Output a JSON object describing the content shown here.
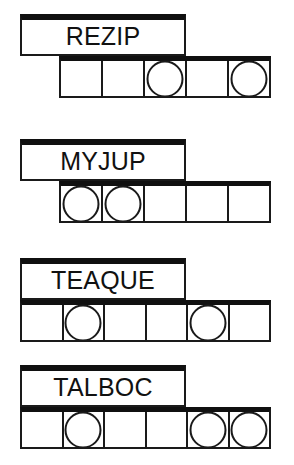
{
  "page": {
    "background_color": "#ffffff",
    "ink_color": "#1a1a1a"
  },
  "puzzles": [
    {
      "word": "REZIP",
      "cell_count": 5,
      "circled_positions": [
        3,
        5
      ],
      "cells": [
        {
          "letter": "",
          "circled": false
        },
        {
          "letter": "",
          "circled": false
        },
        {
          "letter": "",
          "circled": true
        },
        {
          "letter": "",
          "circled": false
        },
        {
          "letter": "",
          "circled": true
        }
      ]
    },
    {
      "word": "MYJUP",
      "cell_count": 5,
      "circled_positions": [
        1,
        2
      ],
      "cells": [
        {
          "letter": "",
          "circled": true
        },
        {
          "letter": "",
          "circled": true
        },
        {
          "letter": "",
          "circled": false
        },
        {
          "letter": "",
          "circled": false
        },
        {
          "letter": "",
          "circled": false
        }
      ]
    },
    {
      "word": "TEAQUE",
      "cell_count": 6,
      "circled_positions": [
        2,
        5
      ],
      "cells": [
        {
          "letter": "",
          "circled": false
        },
        {
          "letter": "",
          "circled": true
        },
        {
          "letter": "",
          "circled": false
        },
        {
          "letter": "",
          "circled": false
        },
        {
          "letter": "",
          "circled": true
        },
        {
          "letter": "",
          "circled": false
        }
      ]
    },
    {
      "word": "TALBOC",
      "cell_count": 6,
      "circled_positions": [
        2,
        5,
        6
      ],
      "cells": [
        {
          "letter": "",
          "circled": false
        },
        {
          "letter": "",
          "circled": true
        },
        {
          "letter": "",
          "circled": false
        },
        {
          "letter": "",
          "circled": false
        },
        {
          "letter": "",
          "circled": true
        },
        {
          "letter": "",
          "circled": true
        }
      ]
    }
  ]
}
